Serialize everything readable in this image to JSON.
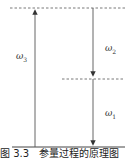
{
  "diagram": {
    "type": "energy-level-diagram",
    "levels": [
      {
        "name": "upper-level",
        "style": "dashed"
      },
      {
        "name": "intermediate-level",
        "style": "dashed"
      },
      {
        "name": "ground-level",
        "style": "solid"
      }
    ],
    "transitions": [
      {
        "label": "ω",
        "sub": "3",
        "direction": "up",
        "from": "ground-level",
        "to": "upper-level"
      },
      {
        "label": "ω",
        "sub": "2",
        "direction": "down",
        "from": "upper-level",
        "to": "intermediate-level"
      },
      {
        "label": "ω",
        "sub": "1",
        "direction": "down",
        "from": "intermediate-level",
        "to": "ground-level"
      }
    ],
    "caption": "图 3.3　参量过程的原理图"
  },
  "colors": {
    "line": "#444444",
    "dash": "#555555",
    "text": "#333333"
  }
}
